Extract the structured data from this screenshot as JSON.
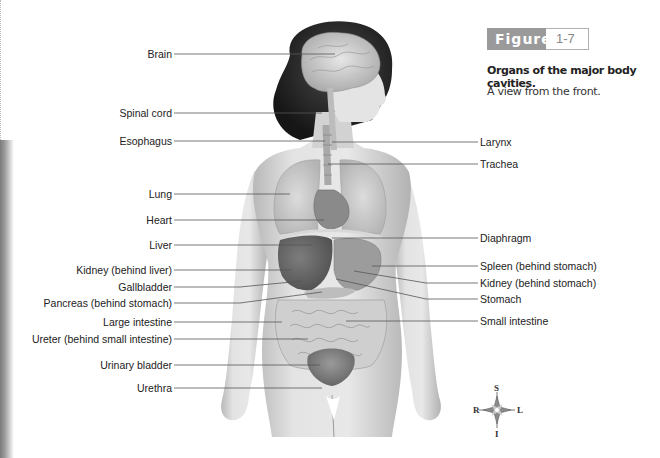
{
  "figure": {
    "badge_label": "Figure",
    "number": "1-7",
    "title": "Organs of the major body cavities.",
    "subtitle": "A view from the front."
  },
  "labels_left": [
    {
      "text": "Brain",
      "y": 54
    },
    {
      "text": "Spinal cord",
      "y": 113
    },
    {
      "text": "Esophagus",
      "y": 141
    },
    {
      "text": "Lung",
      "y": 194
    },
    {
      "text": "Heart",
      "y": 220
    },
    {
      "text": "Liver",
      "y": 245
    },
    {
      "text": "Kidney (behind liver)",
      "y": 270
    },
    {
      "text": "Gallbladder",
      "y": 287
    },
    {
      "text": "Pancreas (behind stomach)",
      "y": 303
    },
    {
      "text": "Large intestine",
      "y": 322
    },
    {
      "text": "Ureter (behind small intestine)",
      "y": 339
    },
    {
      "text": "Urinary bladder",
      "y": 365
    },
    {
      "text": "Urethra",
      "y": 388
    }
  ],
  "labels_right": [
    {
      "text": "Larynx",
      "y": 142
    },
    {
      "text": "Trachea",
      "y": 164
    },
    {
      "text": "Diaphragm",
      "y": 238
    },
    {
      "text": "Spleen (behind stomach)",
      "y": 266
    },
    {
      "text": "Kidney (behind stomach)",
      "y": 283
    },
    {
      "text": "Stomach",
      "y": 299
    },
    {
      "text": "Small intestine",
      "y": 321
    }
  ],
  "compass": {
    "top": "S",
    "bottom": "I",
    "left": "R",
    "right": "L"
  },
  "colors": {
    "badge_bg": "#9a9a9a",
    "badge_text": "#ffffff",
    "leader_line": "#555555",
    "skin": "#d9d9d9",
    "hair": "#2a2a2a"
  }
}
